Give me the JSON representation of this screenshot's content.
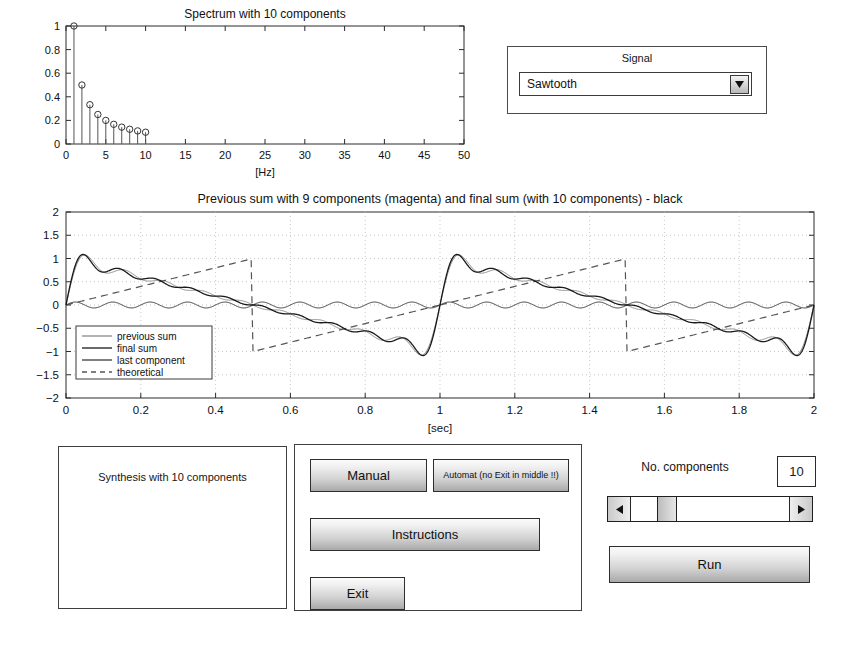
{
  "signal_panel": {
    "label": "Signal",
    "selected": "Sawtooth",
    "arrow_icon": "chevron-down-icon"
  },
  "status": {
    "text": "Synthesis with 10 components"
  },
  "buttons": {
    "manual": "Manual",
    "automat": "Automat (no Exit in middle !!)",
    "instructions": "Instructions",
    "exit": "Exit",
    "run": "Run"
  },
  "slider": {
    "label": "No. components",
    "value": "10",
    "min": 1,
    "max": 50,
    "current": 10,
    "left_arrow_icon": "arrow-left-icon",
    "right_arrow_icon": "arrow-right-icon"
  },
  "chart_data": [
    {
      "type": "bar",
      "id": "spectrum",
      "title": "Spectrum with 10 components",
      "xlabel": "[Hz]",
      "ylabel": "",
      "xlim": [
        0,
        50
      ],
      "ylim": [
        0,
        1
      ],
      "xticks": [
        0,
        5,
        10,
        15,
        20,
        25,
        30,
        35,
        40,
        45,
        50
      ],
      "yticks": [
        0,
        0.2,
        0.4,
        0.6,
        0.8,
        1
      ],
      "grid": false,
      "marker": "circle",
      "categories": [
        1,
        2,
        3,
        4,
        5,
        6,
        7,
        8,
        9,
        10
      ],
      "values": [
        1,
        0.5,
        0.333,
        0.25,
        0.2,
        0.167,
        0.143,
        0.125,
        0.111,
        0.1
      ]
    },
    {
      "type": "line",
      "id": "waveform",
      "title": "Previous sum with 9 components (magenta) and final sum (with 10 components) - black",
      "xlabel": "[sec]",
      "ylabel": "",
      "xlim": [
        0,
        2
      ],
      "ylim": [
        -2,
        2
      ],
      "xticks": [
        0,
        0.2,
        0.4,
        0.6,
        0.8,
        1,
        1.2,
        1.4,
        1.6,
        1.8,
        2
      ],
      "yticks": [
        -2,
        -1.5,
        -1,
        -0.5,
        0,
        0.5,
        1,
        1.5,
        2
      ],
      "grid": true,
      "waveform": "sawtooth",
      "period": 1,
      "amplitude": 2,
      "harmonics_previous": 9,
      "harmonics_final": 10,
      "last_component_order": 10,
      "last_component_amplitude": 0.2,
      "legend_position": "lower left",
      "legend": [
        {
          "name": "previous sum",
          "style": "solid",
          "color": "#8a8a8a"
        },
        {
          "name": "final sum",
          "style": "solid",
          "color": "#1a1a1a"
        },
        {
          "name": "last component",
          "style": "solid",
          "color": "#3a3a3a"
        },
        {
          "name": "theoretical",
          "style": "dashed",
          "color": "#555555"
        }
      ]
    }
  ]
}
